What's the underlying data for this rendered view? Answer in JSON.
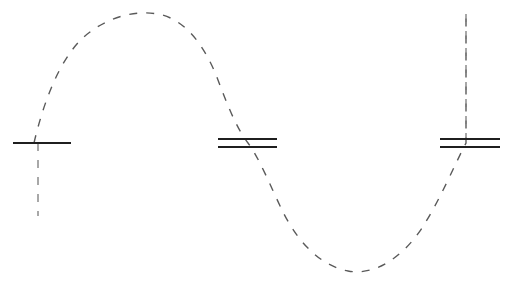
{
  "canvas": {
    "width": 508,
    "height": 284,
    "background": "#ffffff",
    "title": "Standing wave with capacitor-plate markers"
  },
  "style": {
    "wave_color": "#5a5a5a",
    "wave_stroke_width": 1.4,
    "wave_dash_pattern": "8 9",
    "plate_color": "#1f1f1f",
    "plate_stroke_width": 2.0,
    "lead_color": "#7a7a7a",
    "lead_stroke_width": 1.3,
    "lead_dash_pattern": "8 9"
  },
  "chart_data": {
    "type": "line",
    "title": "",
    "xlabel": "",
    "ylabel": "",
    "grid": false,
    "legend": null,
    "xlim": [
      0,
      508
    ],
    "ylim": [
      284,
      0
    ],
    "series": [
      {
        "name": "dashed-sine-wave",
        "style": "dashed",
        "color": "#5a5a5a",
        "x": [
          34,
          60,
          90,
          118,
          145,
          175,
          205,
          228,
          248,
          270,
          292,
          320,
          350,
          368,
          395,
          425,
          450,
          466
        ],
        "y": [
          143,
          75,
          38,
          18,
          12,
          18,
          40,
          85,
          143,
          190,
          225,
          252,
          270,
          272,
          258,
          215,
          150,
          90
        ]
      }
    ],
    "annotations": [
      {
        "label": "peak",
        "x": 145,
        "y": 12
      },
      {
        "label": "trough",
        "x": 368,
        "y": 272
      },
      {
        "label": "zero-crossing-left",
        "x": 34,
        "y": 143
      },
      {
        "label": "zero-crossing-middle",
        "x": 248,
        "y": 143
      },
      {
        "label": "zero-crossing-right",
        "x": 466,
        "y": 143
      }
    ]
  },
  "elements": {
    "wave_path": "M 34 143 C 44 100, 62 52, 90 32 C 110 17, 135 10, 158 14 C 186 19, 206 48, 218 80 C 230 112, 238 130, 248 143 C 260 159, 272 190, 284 214 C 300 245, 322 266, 348 271 C 374 276, 402 258, 422 228 C 440 200, 454 166, 466 143 L 466 14",
    "markers": [
      {
        "id": "marker-left",
        "name": "single-plate-marker",
        "plate_count": 1,
        "plates": [
          {
            "x1": 13,
            "x2": 71,
            "y": 143
          }
        ],
        "lead": {
          "x": 38,
          "y1": 143,
          "y2": 216,
          "direction": "down"
        }
      },
      {
        "id": "marker-middle",
        "name": "double-plate-marker",
        "plate_count": 2,
        "plates": [
          {
            "x1": 218,
            "x2": 277,
            "y": 139
          },
          {
            "x1": 218,
            "x2": 277,
            "y": 147
          }
        ],
        "lead": null
      },
      {
        "id": "marker-right",
        "name": "double-plate-marker",
        "plate_count": 2,
        "plates": [
          {
            "x1": 440,
            "x2": 500,
            "y": 139
          },
          {
            "x1": 440,
            "x2": 500,
            "y": 147
          }
        ],
        "lead": {
          "x": 466,
          "y1": 14,
          "y2": 139,
          "direction": "up"
        }
      }
    ]
  }
}
